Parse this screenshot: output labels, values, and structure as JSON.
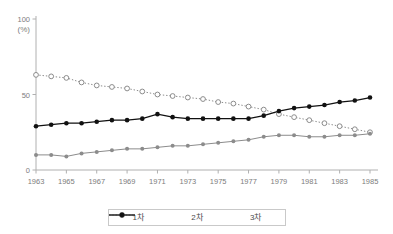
{
  "chart_data": {
    "type": "line",
    "title": "",
    "xlabel": "",
    "ylabel": "(%)",
    "ylim": [
      0,
      100
    ],
    "yticks": [
      0,
      50,
      100
    ],
    "xlim": [
      1963,
      1985
    ],
    "xticks": [
      1963,
      1965,
      1967,
      1969,
      1971,
      1973,
      1975,
      1977,
      1979,
      1981,
      1983,
      1985
    ],
    "grid": false,
    "legend_position": "bottom",
    "x": [
      1963,
      1964,
      1965,
      1966,
      1967,
      1968,
      1969,
      1970,
      1971,
      1972,
      1973,
      1974,
      1975,
      1976,
      1977,
      1978,
      1979,
      1980,
      1981,
      1982,
      1983,
      1984,
      1985
    ],
    "series": [
      {
        "name": "1차",
        "marker": "open-circle",
        "linestyle": "dotted",
        "color": "#8c8c8c",
        "values": [
          63,
          62,
          61,
          58,
          56,
          55,
          54,
          52,
          50,
          49,
          48,
          47,
          45,
          44,
          42,
          40,
          37,
          35,
          33,
          31,
          29,
          27,
          25
        ]
      },
      {
        "name": "2차",
        "marker": "filled-circle",
        "linestyle": "solid",
        "color": "#8c8c8c",
        "values": [
          10,
          10,
          9,
          11,
          12,
          13,
          14,
          14,
          15,
          16,
          16,
          17,
          18,
          19,
          20,
          22,
          23,
          23,
          22,
          22,
          23,
          23,
          24
        ]
      },
      {
        "name": "3차",
        "marker": "filled-diamond",
        "linestyle": "solid",
        "color": "#111111",
        "values": [
          29,
          30,
          31,
          31,
          32,
          33,
          33,
          34,
          37,
          35,
          34,
          34,
          34,
          34,
          34,
          36,
          39,
          41,
          42,
          43,
          45,
          46,
          48
        ]
      }
    ]
  },
  "legend": {
    "items": [
      {
        "label": "1차"
      },
      {
        "label": "2차"
      },
      {
        "label": "3차"
      }
    ]
  },
  "axis": {
    "y_unit": "(%)",
    "y_top": "100",
    "y_mid": "50",
    "y_zero": "0"
  }
}
